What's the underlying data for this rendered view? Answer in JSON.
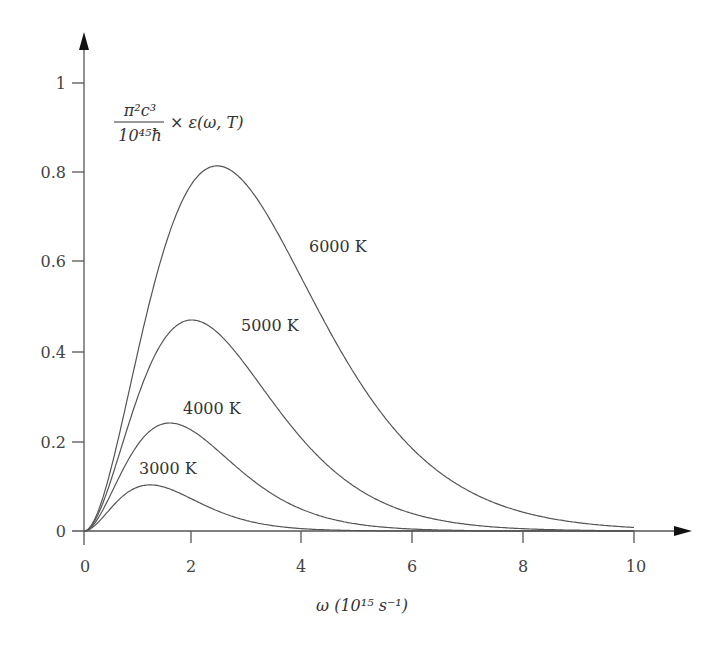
{
  "chart_data": {
    "type": "line",
    "title": "",
    "ylabel": "π²c³/(10⁴⁵ħ) × ε(ω,T)",
    "ylabel_parts": {
      "num": "π²c³",
      "den": "10⁴⁵ħ",
      "rest": "× ε(ω, T)"
    },
    "xlabel": "ω (10¹⁵ s⁻¹)",
    "xlim": [
      0,
      10
    ],
    "ylim": [
      0,
      1
    ],
    "grid": false,
    "legend": "inline labels",
    "x_ticks": [
      "0",
      "2",
      "4",
      "6",
      "8",
      "10"
    ],
    "y_ticks": [
      "0",
      "0.2",
      "0.4",
      "0.6",
      "0.8",
      "1"
    ],
    "x": [
      0,
      1,
      2,
      3,
      4,
      5,
      6,
      7,
      8,
      9,
      10
    ],
    "series": [
      {
        "name": "3000 K",
        "peak_omega": 1.2,
        "peak_value": 0.103,
        "values": [
          0,
          0.101,
          0.072,
          0.034,
          0.013,
          0.004,
          0.001,
          0.0,
          0.0,
          0.0,
          0.0
        ]
      },
      {
        "name": "4000 K",
        "peak_omega": 1.56,
        "peak_value": 0.241,
        "values": [
          0,
          0.196,
          0.222,
          0.145,
          0.074,
          0.032,
          0.012,
          0.004,
          0.001,
          0.0,
          0.0
        ]
      },
      {
        "name": "5000 K",
        "peak_omega": 1.96,
        "peak_value": 0.471,
        "values": [
          0,
          0.3,
          0.471,
          0.381,
          0.243,
          0.131,
          0.063,
          0.028,
          0.011,
          0.004,
          0.002
        ]
      },
      {
        "name": "6000 K",
        "peak_omega": 2.42,
        "peak_value": 0.815,
        "values": [
          0,
          0.411,
          0.782,
          0.767,
          0.554,
          0.335,
          0.18,
          0.089,
          0.041,
          0.018,
          0.008
        ]
      }
    ]
  },
  "labels": {
    "curve_3000": "3000 K",
    "curve_4000": "4000 K",
    "curve_5000": "5000 K",
    "curve_6000": "6000 K",
    "y_num": "π²c³",
    "y_den": "10⁴⁵ħ",
    "y_rest": "× ε(ω, T)",
    "x_axis": "ω (10¹⁵ s⁻¹)"
  }
}
